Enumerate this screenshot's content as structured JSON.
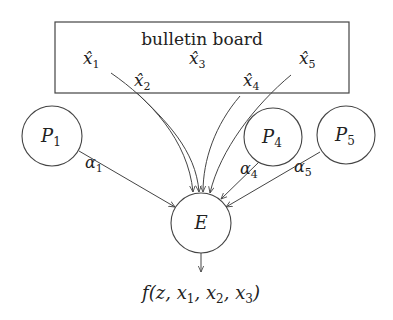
{
  "board": {
    "title": "bulletin board",
    "entries": [
      {
        "label": "x̂",
        "sub": "1"
      },
      {
        "label": "x̂",
        "sub": "2"
      },
      {
        "label": "x̂",
        "sub": "3"
      },
      {
        "label": "x̂",
        "sub": "4"
      },
      {
        "label": "x̂",
        "sub": "5"
      }
    ]
  },
  "parties": [
    {
      "name": "P",
      "sub": "1",
      "edge_label": "α",
      "edge_sub": "1"
    },
    {
      "name": "P",
      "sub": "4",
      "edge_label": "α",
      "edge_sub": "4"
    },
    {
      "name": "P",
      "sub": "5",
      "edge_label": "α",
      "edge_sub": "5"
    }
  ],
  "evaluator": {
    "name": "E"
  },
  "output": {
    "text": "f(z, x",
    "s1": "1",
    "mid1": ", x",
    "s2": "2",
    "mid2": ", x",
    "s3": "3",
    "end": ")"
  },
  "colors": {
    "stroke": "#444444",
    "text": "#222222",
    "background": "#ffffff"
  }
}
